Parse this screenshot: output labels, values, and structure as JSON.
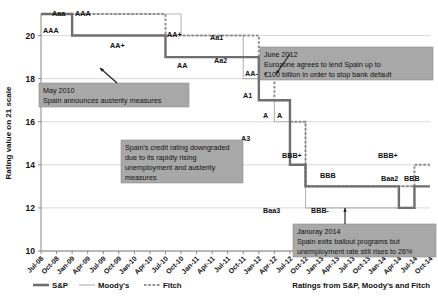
{
  "chart_data": {
    "type": "line",
    "title": "",
    "xlabel": "",
    "ylabel": "Rating value on 21 scale",
    "ylim": [
      10,
      21
    ],
    "yticks": [
      10,
      12,
      14,
      16,
      18,
      20
    ],
    "grid": true,
    "legend_position": "bottom-left",
    "source_note": "Ratings from S&P, Moody's and Fitch",
    "x": [
      "Jul-08",
      "Oct-08",
      "Jan-09",
      "Apr-09",
      "Jul-09",
      "Oct-09",
      "Jan-10",
      "Apr-10",
      "Jul-10",
      "Oct-10",
      "Jan-11",
      "Apr-11",
      "Jul-11",
      "Oct-11",
      "Jan-12",
      "Apr-12",
      "Jul-12",
      "Oct-12",
      "Jan-13",
      "Apr-13",
      "Jul-13",
      "Oct-13",
      "Jan-14",
      "Apr-14",
      "Jul-14",
      "Oct-14"
    ],
    "series": [
      {
        "name": "S&P",
        "color": "#6e6e6e",
        "style": "solid-thick",
        "values": [
          21,
          21,
          20,
          20,
          20,
          20,
          20,
          20,
          19,
          19,
          19,
          19,
          19,
          19,
          17,
          17,
          14,
          13,
          13,
          13,
          13,
          13,
          13,
          12,
          13,
          13
        ]
      },
      {
        "name": "Moody's",
        "color": "#b5b5b5",
        "style": "solid-thin",
        "values": [
          21,
          21,
          21,
          21,
          21,
          21,
          21,
          21,
          21,
          20,
          20,
          20,
          20,
          18,
          17,
          16,
          16,
          12,
          12,
          12,
          12,
          12,
          12,
          13,
          13,
          13
        ]
      },
      {
        "name": "Fitch",
        "color": "#8f8f8f",
        "style": "dotted",
        "values": [
          21,
          21,
          21,
          21,
          21,
          21,
          21,
          21,
          20,
          20,
          20,
          20,
          20,
          20,
          18,
          17,
          16,
          13,
          13,
          13,
          13,
          13,
          13,
          13,
          14,
          14
        ]
      }
    ],
    "point_labels": [
      {
        "text": "Aaa",
        "x": 52,
        "y": 16
      },
      {
        "text": "AAA",
        "x": 75,
        "y": 16
      },
      {
        "text": "AAA",
        "x": 43,
        "y": 33
      },
      {
        "text": "AA+",
        "x": 110,
        "y": 48
      },
      {
        "text": "AA+",
        "x": 167,
        "y": 37
      },
      {
        "text": "Aa1",
        "x": 210,
        "y": 40
      },
      {
        "text": "AA",
        "x": 177,
        "y": 68
      },
      {
        "text": "Aa2",
        "x": 214,
        "y": 63
      },
      {
        "text": "AA-",
        "x": 245,
        "y": 76
      },
      {
        "text": "AA-",
        "x": 262,
        "y": 76
      },
      {
        "text": "A1",
        "x": 243,
        "y": 98
      },
      {
        "text": "A",
        "x": 263,
        "y": 118
      },
      {
        "text": "A",
        "x": 277,
        "y": 118
      },
      {
        "text": "A3",
        "x": 241,
        "y": 141
      },
      {
        "text": "BBB+",
        "x": 282,
        "y": 158
      },
      {
        "text": "BBB+",
        "x": 378,
        "y": 158
      },
      {
        "text": "BBB",
        "x": 320,
        "y": 178
      },
      {
        "text": "Baa2",
        "x": 381,
        "y": 181
      },
      {
        "text": "BBB",
        "x": 404,
        "y": 181
      },
      {
        "text": "Baa3",
        "x": 263,
        "y": 213
      },
      {
        "text": "BBB-",
        "x": 311,
        "y": 213
      }
    ],
    "annotations": [
      {
        "name": "may-2010",
        "lines": [
          "May 2010",
          "Spain announces austerity measures"
        ],
        "x": 39,
        "y": 83,
        "w": 150,
        "h": 24
      },
      {
        "name": "june-2012",
        "lines": [
          "June 2012",
          "Eurozone agrees to lend Spain up to",
          "€100 billion in order to stop bank default"
        ],
        "x": 260,
        "y": 47,
        "w": 173,
        "h": 33
      },
      {
        "name": "credit-downgrade",
        "lines": [
          "Spain's credit rating downgraded",
          "due to its rapidly rising",
          "unemployment and austerity",
          "measures"
        ],
        "x": 121,
        "y": 140,
        "w": 122,
        "h": 43
      },
      {
        "name": "january-2014",
        "lines": [
          "Januray 2014",
          "Spain exits bailout programs but",
          "unemployment rate still rises to 26%"
        ],
        "x": 293,
        "y": 224,
        "w": 143,
        "h": 33
      }
    ]
  },
  "legend": {
    "items": [
      {
        "label": "S&P",
        "color": "#6e6e6e",
        "style": "solid-thick"
      },
      {
        "label": "Moody's",
        "color": "#b5b5b5",
        "style": "solid-thin"
      },
      {
        "label": "Fitch",
        "color": "#8f8f8f",
        "style": "dotted"
      }
    ]
  },
  "colors": {
    "sp": "#6e6e6e",
    "moodys": "#b5b5b5",
    "fitch": "#8f8f8f",
    "grid": "#c9c9c9",
    "axis": "#7a7a7a",
    "annotation_bg": "#a8a8a8",
    "background": "#ffffff"
  }
}
